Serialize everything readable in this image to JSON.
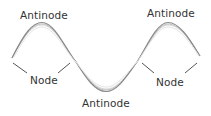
{
  "diagram": {
    "type": "standing-wave",
    "labels": {
      "antinode_left": "Antinode",
      "antinode_right": "Antinode",
      "antinode_bottom": "Antinode",
      "node_left": "Node",
      "node_right": "Node"
    },
    "colors": {
      "wave": "#8a8a8a",
      "wave_light": "#c8c8c8",
      "leader": "#555555",
      "text": "#333333"
    }
  }
}
